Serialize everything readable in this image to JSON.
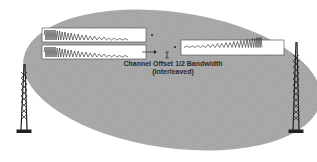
{
  "diagram": {
    "caption_line1": "Channel Offset 1/2 Bandwidth",
    "caption_line2": "(Interleaved)",
    "elements": [
      {
        "type": "ellipse",
        "name": "coverage-area",
        "color": "#a8a8a8"
      },
      {
        "type": "tower",
        "name": "left-tower"
      },
      {
        "type": "tower",
        "name": "right-tower"
      },
      {
        "type": "waveform-box",
        "name": "waveform-top-left",
        "direction": "decreasing-frequency"
      },
      {
        "type": "waveform-box",
        "name": "waveform-bottom-left",
        "direction": "decreasing-frequency"
      },
      {
        "type": "waveform-box",
        "name": "waveform-right",
        "direction": "increasing-frequency"
      }
    ],
    "colors": {
      "ellipse": "#a8a8a8",
      "box_fill": "#ffffff",
      "stroke": "#222222"
    }
  }
}
